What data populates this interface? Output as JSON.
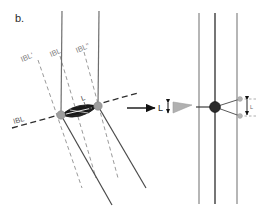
{
  "figure": {
    "panel_label": "b.",
    "background_color": "#ffffff"
  },
  "colors": {
    "solid_band": "#6e6e6e",
    "dark_band": "#3c3c3c",
    "dashed_band": "#9a9a9a",
    "lens_fill": "#1a1a1a",
    "node_gray": "#9e9e9e",
    "node_dark": "#2a2a2a",
    "wedge_fill": "#b0b0b0",
    "arrow_black": "#111111",
    "label_gray": "#7d7d7d",
    "label_dark": "#2b2b2b"
  },
  "left_panel": {
    "name": "pre-transformation-block-diagram",
    "band_labels": [
      {
        "id": "ibl-prime",
        "text": "IBL'",
        "x": 22,
        "y": 62
      },
      {
        "id": "ibl",
        "text": "IBL",
        "x": 51,
        "y": 57
      },
      {
        "id": "ibl-double-prime",
        "text": "IBL\"",
        "x": 77,
        "y": 53
      }
    ],
    "horizontal_band_label": {
      "id": "ibl-horizontal",
      "text": "IBL",
      "x": 14,
      "y": 124
    },
    "lens_label": {
      "id": "lens-L",
      "text": "L",
      "x": 82,
      "y": 101
    },
    "nodes": [
      {
        "id": "left-node",
        "cx": 61,
        "cy": 115,
        "r": 4.2
      },
      {
        "id": "right-node",
        "cx": 98,
        "cy": 106,
        "r": 4.2
      }
    ],
    "vertical_bands": [
      {
        "id": "vertical-band-1",
        "x1": 62,
        "y1": 11,
        "x2": 61,
        "y2": 115
      },
      {
        "id": "vertical-band-2",
        "x1": 99,
        "y1": 11,
        "x2": 98,
        "y2": 106
      }
    ],
    "lower_solid_bands": [
      {
        "id": "lower-solid-1",
        "x1": 61,
        "y1": 115,
        "x2": 112,
        "y2": 205
      },
      {
        "id": "lower-solid-2",
        "x1": 98,
        "y1": 106,
        "x2": 146,
        "y2": 188
      }
    ],
    "dashed_bands": [
      {
        "id": "dashed-band-1",
        "x1": 38,
        "y1": 60,
        "x2": 82,
        "y2": 188
      },
      {
        "id": "dashed-band-2",
        "x1": 60,
        "y1": 56,
        "x2": 96,
        "y2": 178
      },
      {
        "id": "dashed-band-3",
        "x1": 84,
        "y1": 52,
        "x2": 118,
        "y2": 178
      }
    ],
    "horizontal_dashed_band": {
      "id": "ibl-horizontal-line",
      "x1": 12,
      "y1": 128,
      "x2": 138,
      "y2": 93
    }
  },
  "transform": {
    "arrow_label": "L",
    "arrow_name": "transformation-arrow",
    "wedge_name": "lens-wedge-symbol",
    "thickness_marker_name": "lens-thickness-double-arrow"
  },
  "right_panel": {
    "name": "post-transformation-block-diagram",
    "nodes": [
      {
        "id": "right-panel-node",
        "cx": 215,
        "cy": 107,
        "r": 5.4
      }
    ],
    "vertical_bands": [
      {
        "id": "r-vertical-band-1",
        "x1": 199,
        "y1": 13,
        "x2": 199,
        "y2": 204
      },
      {
        "id": "r-vertical-band-2",
        "x1": 215,
        "y1": 13,
        "x2": 215,
        "y2": 204
      },
      {
        "id": "r-vertical-band-3",
        "x1": 237,
        "y1": 13,
        "x2": 237,
        "y2": 204
      }
    ],
    "thickness_label": "L",
    "thickness_marker_name": "right-thickness-double-arrow"
  }
}
